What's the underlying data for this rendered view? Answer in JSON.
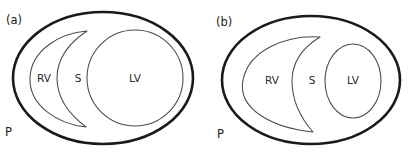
{
  "figure": {
    "background_color": "#ffffff",
    "outer_wall_color": "#1a1a1a",
    "chamber_outline_color": "#4a4a4a"
  },
  "panels": [
    {
      "id": "a",
      "panel_label": "(a)",
      "pericardium_label": "P",
      "regions": [
        {
          "key": "rv",
          "label": "RV",
          "shape": "thin-crescent"
        },
        {
          "key": "septum",
          "label": "S",
          "shape": "septal-band"
        },
        {
          "key": "lv",
          "label": "LV",
          "shape": "large-circle"
        }
      ]
    },
    {
      "id": "b",
      "panel_label": "(b)",
      "pericardium_label": "P",
      "regions": [
        {
          "key": "rv",
          "label": "RV",
          "shape": "dilated-crescent"
        },
        {
          "key": "septum",
          "label": "S",
          "shape": "septal-band"
        },
        {
          "key": "lv",
          "label": "LV",
          "shape": "small-ellipse"
        }
      ]
    }
  ]
}
